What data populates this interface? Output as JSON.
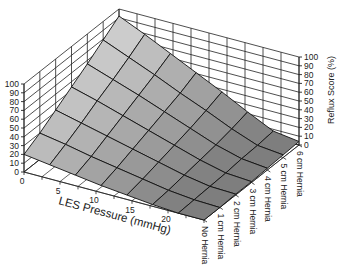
{
  "chart_data": {
    "type": "surface3d",
    "title": "",
    "x_axis": {
      "label": "LES Pressure (mmHg)",
      "ticks": [
        0,
        5,
        10,
        15,
        20
      ],
      "range": [
        0,
        25
      ]
    },
    "y_axis": {
      "label": "",
      "categories": [
        "No Hernia",
        "1 cm Hernia",
        "2 cm Hernia",
        "3 cm Hernia",
        "4 cm Hernia",
        "5 cm Hernia",
        "6 cm Hernia"
      ]
    },
    "z_axis": {
      "label": "Reflux Score (%)",
      "ticks": [
        0,
        10,
        20,
        30,
        40,
        50,
        60,
        70,
        80,
        90,
        100
      ],
      "range": [
        0,
        100
      ]
    },
    "grid": true,
    "surface_les_values": [
      0,
      3.57,
      7.14,
      10.71,
      14.29,
      17.86,
      21.43,
      25
    ],
    "surface_z": [
      [
        20,
        16,
        12,
        8,
        5,
        2,
        0,
        0
      ],
      [
        30,
        25,
        19,
        14,
        9,
        4,
        1,
        0
      ],
      [
        42,
        35,
        28,
        21,
        14,
        7,
        2,
        1
      ],
      [
        54,
        46,
        37,
        28,
        19,
        10,
        3,
        1
      ],
      [
        66,
        56,
        46,
        35,
        24,
        13,
        5,
        2
      ],
      [
        79,
        67,
        55,
        42,
        30,
        17,
        6,
        3
      ],
      [
        92,
        79,
        65,
        51,
        37,
        22,
        8,
        4
      ]
    ],
    "surface_z_note": "rows = hernia category (No Hernia .. 6 cm Hernia), columns = LES pressure values"
  },
  "colors": {
    "surface_light": "#d2d2d2",
    "surface_dark": "#7e7e7e",
    "grid_line": "#111111",
    "wall_line": "#222222"
  }
}
